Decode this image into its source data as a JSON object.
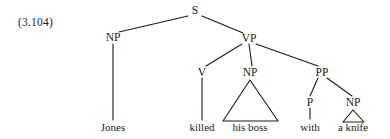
{
  "figure": {
    "example_number": "(3.104)",
    "kind": "syntax-tree",
    "sentence": "Jones killed his boss with a knife"
  },
  "nodes": {
    "s": "S",
    "np_subject": "NP",
    "vp": "VP",
    "v": "V",
    "np_object": "NP",
    "pp": "PP",
    "p": "P",
    "np_oblique": "NP"
  },
  "leaves": {
    "jones": "Jones",
    "killed": "killed",
    "his_boss": "his boss",
    "with": "with",
    "a_knife": "a knife"
  },
  "style": {
    "ink": "#1a1a1a",
    "background": "#ffffff"
  }
}
